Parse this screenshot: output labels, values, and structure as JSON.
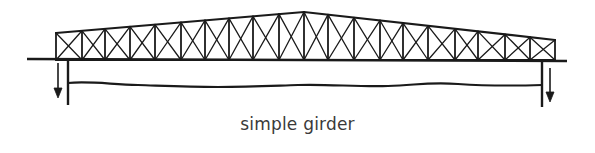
{
  "diagram": {
    "caption": "simple girder",
    "stroke_color": "#1a1a1a",
    "background": "#ffffff",
    "truss": {
      "type": "cross-braced truss (simple span)",
      "panel_posts_x": [
        56,
        82,
        105,
        130,
        155,
        181,
        205,
        229,
        253,
        279,
        304,
        328,
        354,
        380,
        403,
        428,
        455,
        478,
        505,
        530,
        555
      ],
      "peak": {
        "x": 304,
        "y": 12
      },
      "left_end_top_y": 33,
      "right_end_top_y": 40,
      "bottom_chord_y": 60
    },
    "deck_line": {
      "x1": 27,
      "x2": 567,
      "y": 59
    },
    "supports": [
      {
        "side": "left",
        "x": 68,
        "y_top": 59,
        "y_bottom": 105
      },
      {
        "side": "right",
        "x": 542,
        "y_top": 62,
        "y_bottom": 107
      }
    ],
    "reaction_arrows": [
      {
        "side": "left",
        "x": 58,
        "y_start": 63,
        "y_end": 98,
        "direction": "down"
      },
      {
        "side": "right",
        "x": 550,
        "y_start": 68,
        "y_end": 102,
        "direction": "down"
      }
    ],
    "ground_line": {
      "description": "wavy water/ground line between supports",
      "x1": 68,
      "x2": 542,
      "y": 85
    }
  }
}
